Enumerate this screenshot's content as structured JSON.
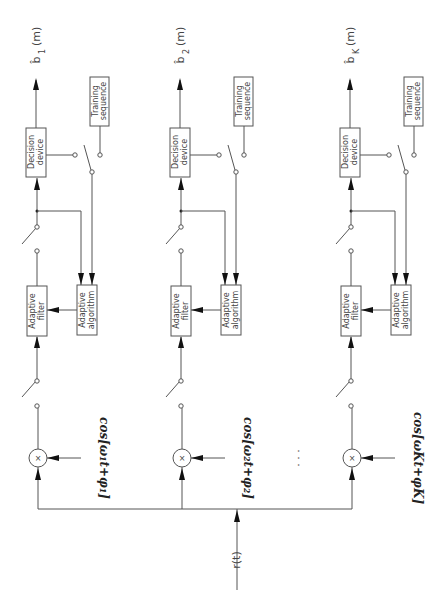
{
  "diagram": {
    "orientation": "rotated 90 degrees clockwise",
    "input": {
      "label": "r(t)"
    },
    "branches": [
      {
        "id": 1,
        "output_label": "b̂",
        "output_sub": "1",
        "output_arg": "(m)",
        "decision_device": [
          "Decision",
          "device"
        ],
        "training_sequence": [
          "Training",
          "sequence"
        ],
        "adaptive_filter": [
          "Adaptive",
          "filter"
        ],
        "adaptive_algorithm": [
          "Adaptive",
          "algorithm"
        ],
        "oscillator": "cos[ω₁t+φ₁]"
      },
      {
        "id": 2,
        "output_label": "b̂",
        "output_sub": "2",
        "output_arg": "(m)",
        "decision_device": [
          "Decision",
          "device"
        ],
        "training_sequence": [
          "Training",
          "sequence"
        ],
        "adaptive_filter": [
          "Adaptive",
          "filter"
        ],
        "adaptive_algorithm": [
          "Adaptive",
          "algorithm"
        ],
        "oscillator": "cos[ω₂t+φ₂]"
      },
      {
        "id": 3,
        "output_label": "b̂",
        "output_sub": "K",
        "output_arg": "(m)",
        "decision_device": [
          "Decision",
          "device"
        ],
        "training_sequence": [
          "Training",
          "sequence"
        ],
        "adaptive_filter": [
          "Adaptive",
          "filter"
        ],
        "adaptive_algorithm": [
          "Adaptive",
          "algorithm"
        ],
        "oscillator": "cos[ωKt+φK]"
      }
    ],
    "multiplier_symbol": "×",
    "ellipsis": "· · ·"
  }
}
